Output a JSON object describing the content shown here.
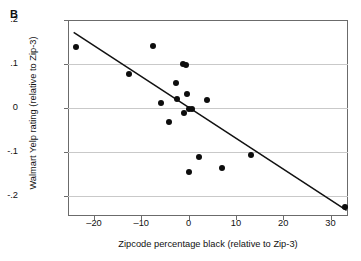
{
  "panel": {
    "label": "B"
  },
  "chart_data": {
    "type": "scatter",
    "title": "",
    "xlabel": "Zipcode percentage black (relative to Zip-3)",
    "ylabel": "Walmart Yelp rating (relative to Zip-3)",
    "xlim": [
      -25.5,
      33.7
    ],
    "ylim": [
      -0.245,
      0.2
    ],
    "grid": "horizontal",
    "legend": "none",
    "xticks": [
      -20,
      -10,
      0,
      10,
      20,
      30
    ],
    "xticklabels": [
      "–20",
      "–10",
      "0",
      "10",
      "20",
      "30"
    ],
    "yticks": [
      0.2,
      0.1,
      0,
      -0.1,
      -0.2
    ],
    "yticklabels": [
      ".2",
      ".1",
      "0",
      "-.1",
      "-.2"
    ],
    "points": [
      {
        "x": -23.9,
        "y": 0.138
      },
      {
        "x": -12.6,
        "y": 0.077
      },
      {
        "x": -7.6,
        "y": 0.141
      },
      {
        "x": -5.9,
        "y": 0.011
      },
      {
        "x": -4.1,
        "y": -0.032
      },
      {
        "x": -2.6,
        "y": 0.056
      },
      {
        "x": -2.4,
        "y": 0.02
      },
      {
        "x": -1.2,
        "y": 0.101
      },
      {
        "x": -0.5,
        "y": 0.098
      },
      {
        "x": -0.9,
        "y": -0.012
      },
      {
        "x": -0.3,
        "y": 0.033
      },
      {
        "x": 0.1,
        "y": -0.001
      },
      {
        "x": 0.8,
        "y": -0.002
      },
      {
        "x": 0.0,
        "y": -0.145
      },
      {
        "x": 2.2,
        "y": -0.112
      },
      {
        "x": 3.9,
        "y": 0.018
      },
      {
        "x": 7.0,
        "y": -0.136
      },
      {
        "x": 13.1,
        "y": -0.107
      },
      {
        "x": 33.0,
        "y": -0.225
      }
    ],
    "fit_line": {
      "type": "linear",
      "x_start": -24.3,
      "y_start": 0.172,
      "x_end": 33.4,
      "y_end": -0.232
    },
    "colors": {
      "marker": "#0d0d0d",
      "line": "#111111",
      "grid": "#c9c9c9",
      "axis": "#6b6b6b",
      "background": "#ffffff"
    }
  }
}
